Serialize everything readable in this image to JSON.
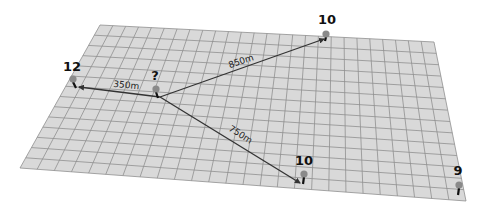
{
  "diagram": {
    "plane": {
      "corners": {
        "top_left": [
          100,
          25
        ],
        "top_right": [
          434,
          42
        ],
        "bottom_right": [
          466,
          201
        ],
        "bottom_left": [
          20,
          168
        ]
      },
      "grid_cols": 26,
      "grid_rows": 14,
      "fill_color": "#d9d9d9",
      "grid_color": "#8f8f8f"
    },
    "center": {
      "label": "?",
      "label_pos": [
        155,
        80
      ],
      "head": [
        156,
        89
      ],
      "base": [
        158,
        98
      ]
    },
    "pins": [
      {
        "id": "pin-left",
        "label": "12",
        "label_pos": [
          72,
          71
        ],
        "head": [
          73,
          79
        ],
        "base": [
          76,
          88
        ]
      },
      {
        "id": "pin-top",
        "label": "10",
        "label_pos": [
          327,
          24
        ],
        "head": [
          326,
          34
        ],
        "base": [
          325,
          41
        ]
      },
      {
        "id": "pin-bottom",
        "label": "10",
        "label_pos": [
          304,
          165
        ],
        "head": [
          304,
          174
        ],
        "base": [
          303,
          184
        ]
      },
      {
        "id": "pin-right",
        "label": "9",
        "label_pos": [
          458,
          175
        ],
        "head": [
          459,
          185
        ],
        "base": [
          458,
          195
        ]
      }
    ],
    "connections": [
      {
        "from": [
          160,
          97
        ],
        "to": [
          79,
          87
        ],
        "label": "350m",
        "label_pos": [
          126,
          88
        ],
        "angle": 6
      },
      {
        "from": [
          160,
          97
        ],
        "to": [
          324,
          39
        ],
        "label": "850m",
        "label_pos": [
          242,
          64
        ],
        "angle": -19
      },
      {
        "from": [
          160,
          97
        ],
        "to": [
          300,
          183
        ],
        "label": "750m",
        "label_pos": [
          239,
          137
        ],
        "angle": 33
      }
    ],
    "colors": {
      "line": "#333333",
      "pin_head": "#8a8a8a",
      "pin_stem": "#111111",
      "text": "#111111"
    }
  }
}
